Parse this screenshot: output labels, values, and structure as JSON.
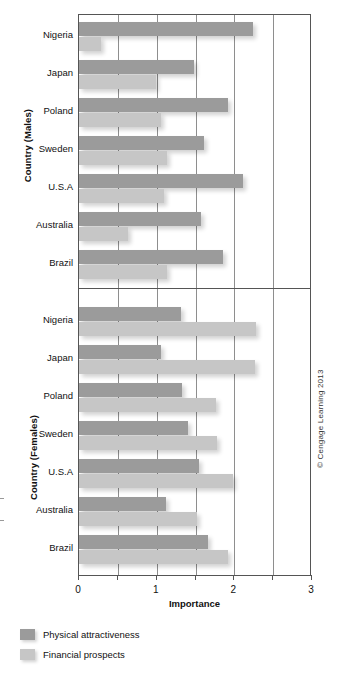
{
  "chart_data": {
    "type": "bar",
    "orientation": "horizontal",
    "title": "",
    "xlabel": "Importance",
    "xlim": [
      0,
      3
    ],
    "xticks": [
      0,
      0.5,
      1,
      1.5,
      2,
      2.5,
      3
    ],
    "xtick_labels": [
      "0",
      "",
      "1",
      "",
      "2",
      "",
      "3"
    ],
    "grid": "vertical",
    "legend_position": "bottom-left",
    "series": [
      {
        "name": "Physical attractiveness",
        "color": "#9b9b9b"
      },
      {
        "name": "Financial prospects",
        "color": "#c6c6c6"
      }
    ],
    "panels": [
      {
        "ylabel": "Country (Males)",
        "categories": [
          "Nigeria",
          "Japan",
          "Poland",
          "Sweden",
          "U.S.A",
          "Australia",
          "Brazil"
        ],
        "series": [
          {
            "name": "Physical attractiveness",
            "values": [
              2.24,
              1.48,
              1.92,
              1.61,
              2.11,
              1.57,
              1.85
            ]
          },
          {
            "name": "Financial prospects",
            "values": [
              0.28,
              0.99,
              1.06,
              1.13,
              1.09,
              0.63,
              1.13
            ]
          }
        ]
      },
      {
        "ylabel": "Country (Females)",
        "categories": [
          "Nigeria",
          "Japan",
          "Poland",
          "Sweden",
          "U.S.A",
          "Australia",
          "Brazil"
        ],
        "series": [
          {
            "name": "Physical attractiveness",
            "values": [
              1.31,
              1.06,
              1.33,
              1.4,
              1.55,
              1.12,
              1.66
            ]
          },
          {
            "name": "Financial prospects",
            "values": [
              2.28,
              2.27,
              1.76,
              1.78,
              1.98,
              1.52,
              1.92
            ]
          }
        ]
      }
    ]
  },
  "axes": {
    "y_title_males": "Country (Males)",
    "y_title_females": "Country (Females)",
    "x_title": "Importance",
    "x_labels": [
      "0",
      "1",
      "2",
      "3"
    ]
  },
  "legend": {
    "items": [
      {
        "label": "Physical attractiveness",
        "color": "#9b9b9b"
      },
      {
        "label": "Financial prospects",
        "color": "#c6c6c6"
      }
    ]
  },
  "credit": "© Cengage Learning 2013"
}
